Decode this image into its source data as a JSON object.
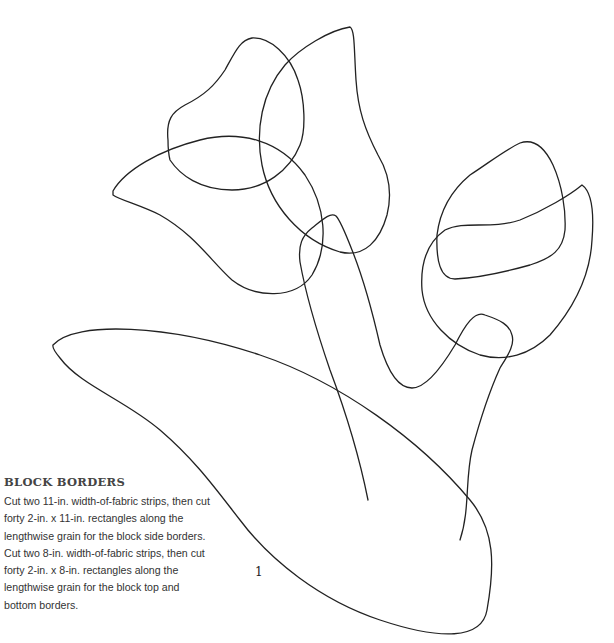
{
  "illustration": {
    "subject": "tulip quilting template outline",
    "stroke_color": "#222222",
    "background_color": "#ffffff"
  },
  "instructions": {
    "heading": "BLOCK BORDERS",
    "body": "Cut two 11-in. width-of-fabric strips, then cut forty 2-in. x 11-in. rectangles along the lengthwise grain for the block side borders. Cut two 8-in. width-of-fabric strips, then cut forty 2-in. x 8-in. rectangles along the lengthwise grain for the block top and bottom borders."
  },
  "page": {
    "number": "1"
  }
}
